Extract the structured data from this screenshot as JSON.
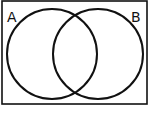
{
  "diagram": {
    "type": "venn",
    "universe": {
      "x": 2,
      "y": 1,
      "width": 145,
      "height": 103
    },
    "sets": [
      {
        "label": "A",
        "cx": 52,
        "cy": 54,
        "r": 45,
        "label_x": 7,
        "label_y": 22
      },
      {
        "label": "B",
        "cx": 98,
        "cy": 54,
        "r": 45,
        "label_x": 131,
        "label_y": 22
      }
    ],
    "colors": {
      "stroke": "#111111",
      "background": "#ffffff"
    }
  }
}
